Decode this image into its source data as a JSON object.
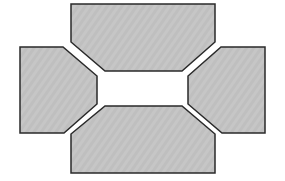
{
  "diagram": {
    "fill_color": "#c6c6c6",
    "stroke_color": "#2a2a2a",
    "background": "#ffffff",
    "shapes": [
      {
        "name": "top-panel",
        "points": "71,4 215,4 215,42 182,71 105,71 71,42"
      },
      {
        "name": "left-panel",
        "points": "20,47 63,47 97,76 97,104 64,133 20,133"
      },
      {
        "name": "right-panel",
        "points": "221,47 265,47 265,133 222,133 188,104 188,76"
      },
      {
        "name": "bottom-panel",
        "points": "105,106 182,106 215,134 215,173 71,173 71,134"
      }
    ]
  }
}
